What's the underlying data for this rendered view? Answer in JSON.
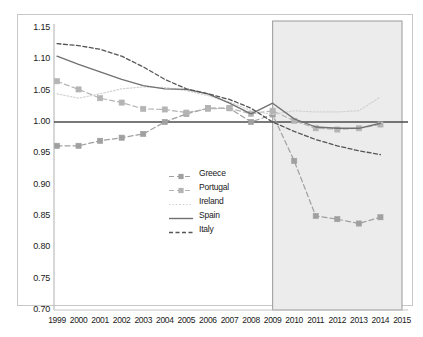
{
  "chart_data": {
    "type": "line",
    "title": "",
    "xlabel": "",
    "ylabel": "",
    "grid": false,
    "legend_position": "center",
    "x": [
      1999,
      2000,
      2001,
      2002,
      2003,
      2004,
      2005,
      2006,
      2007,
      2008,
      2009,
      2010,
      2011,
      2012,
      2013,
      2014,
      2015
    ],
    "categories": [
      "1999",
      "2000",
      "2001",
      "2002",
      "2003",
      "2004",
      "2005",
      "2006",
      "2007",
      "2008",
      "2009",
      "2010",
      "2011",
      "2012",
      "2013",
      "2014",
      "2015"
    ],
    "ylim": [
      0.7,
      1.15
    ],
    "yticks": [
      "1.15",
      "1.10",
      "1.05",
      "1.00",
      "0.95",
      "0.90",
      "0.85",
      "0.80",
      "0.75",
      "0.70"
    ],
    "ytick_values": [
      1.15,
      1.1,
      1.05,
      1.0,
      0.95,
      0.9,
      0.85,
      0.8,
      0.75,
      0.7
    ],
    "reference_line": 1.0,
    "shaded_region": {
      "from": 2009,
      "to": 2015,
      "color": "#ececec"
    },
    "series": [
      {
        "name": "Greece",
        "color": "#a0a0a0",
        "style": "dashed",
        "marker": "square",
        "values": [
          0.962,
          0.962,
          0.97,
          0.975,
          0.981,
          1.0,
          1.013,
          1.022,
          1.022,
          1.0,
          1.012,
          0.938,
          0.85,
          0.845,
          0.838,
          0.848,
          null
        ]
      },
      {
        "name": "Portugal",
        "color": "#b4b4b4",
        "style": "dashed",
        "marker": "square",
        "values": [
          1.065,
          1.052,
          1.038,
          1.031,
          1.021,
          1.02,
          1.015,
          1.021,
          1.022,
          1.013,
          1.018,
          1.002,
          0.99,
          0.988,
          0.99,
          0.996,
          null
        ]
      },
      {
        "name": "Ireland",
        "color": "#d2d2d2",
        "style": "dotted",
        "marker": "none",
        "values": [
          1.045,
          1.038,
          1.045,
          1.053,
          1.056,
          1.055,
          1.05,
          1.042,
          1.032,
          1.018,
          1.012,
          1.018,
          1.016,
          1.016,
          1.018,
          1.04,
          null
        ]
      },
      {
        "name": "Spain",
        "color": "#707070",
        "style": "solid",
        "marker": "none",
        "values": [
          1.105,
          1.092,
          1.08,
          1.068,
          1.058,
          1.053,
          1.052,
          1.045,
          1.03,
          1.013,
          1.03,
          1.005,
          0.992,
          0.99,
          0.99,
          0.998,
          null
        ]
      },
      {
        "name": "Italy",
        "color": "#555555",
        "style": "dashed",
        "marker": "none",
        "values": [
          1.125,
          1.122,
          1.116,
          1.105,
          1.088,
          1.068,
          1.053,
          1.045,
          1.036,
          1.022,
          1.0,
          0.985,
          0.972,
          0.962,
          0.954,
          0.948,
          null
        ]
      }
    ]
  },
  "legend": {
    "items": [
      {
        "label": "Greece"
      },
      {
        "label": "Portugal"
      },
      {
        "label": "Ireland"
      },
      {
        "label": "Spain"
      },
      {
        "label": "Italy"
      }
    ]
  }
}
